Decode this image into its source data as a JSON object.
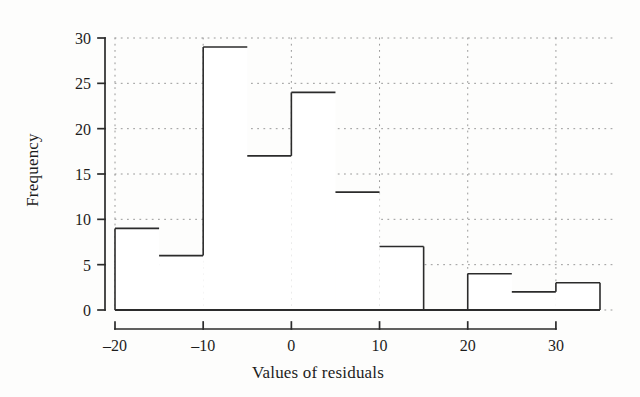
{
  "chart_data": {
    "type": "bar",
    "title": "",
    "subtitle": "",
    "xlabel": "Values of residuals",
    "ylabel": "Frequency",
    "xlim": [
      -20,
      35
    ],
    "ylim": [
      0,
      30
    ],
    "grid": true,
    "legend_position": "none",
    "bin_width": 5,
    "bin_edges": [
      -20,
      -15,
      -10,
      -5,
      0,
      5,
      10,
      15,
      20,
      25,
      30,
      35
    ],
    "categories": [
      "-20 to -15",
      "-15 to -10",
      "-10 to -5",
      "-5 to 0",
      "0 to 5",
      "5 to 10",
      "10 to 15",
      "15 to 20",
      "20 to 25",
      "25 to 30",
      "30 to 35"
    ],
    "values": [
      9,
      6,
      29,
      17,
      24,
      13,
      7,
      0,
      4,
      2,
      3
    ],
    "bars": [
      {
        "start": -20,
        "end": -15,
        "value": 9
      },
      {
        "start": -15,
        "end": -10,
        "value": 6
      },
      {
        "start": -10,
        "end": -5,
        "value": 29
      },
      {
        "start": -5,
        "end": 0,
        "value": 17
      },
      {
        "start": 0,
        "end": 5,
        "value": 24
      },
      {
        "start": 5,
        "end": 10,
        "value": 13
      },
      {
        "start": 10,
        "end": 15,
        "value": 7
      },
      {
        "start": 15,
        "end": 20,
        "value": 0
      },
      {
        "start": 20,
        "end": 25,
        "value": 4
      },
      {
        "start": 25,
        "end": 30,
        "value": 2
      },
      {
        "start": 30,
        "end": 35,
        "value": 3
      }
    ],
    "xticks": [
      -20,
      -10,
      0,
      10,
      20,
      30
    ],
    "xtick_labels": [
      "–20",
      "–10",
      "0",
      "10",
      "20",
      "30"
    ],
    "yticks": [
      0,
      5,
      10,
      15,
      20,
      25,
      30
    ],
    "ytick_labels": [
      "0",
      "5",
      "10",
      "15",
      "20",
      "25",
      "30"
    ],
    "colors": {
      "bar_fill": "#ffffff",
      "bar_stroke": "#2b2b2b",
      "grid": "#8d8d8d",
      "axis": "#2b2b2b",
      "text": "#1d1d1d",
      "background": "#fdfdfc"
    }
  }
}
